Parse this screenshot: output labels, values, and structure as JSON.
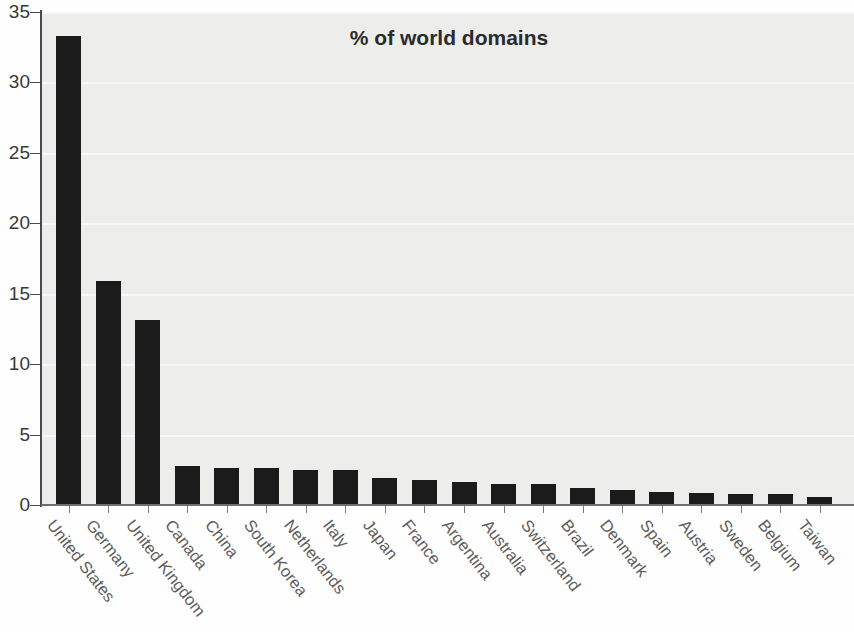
{
  "chart_data": {
    "type": "bar",
    "title": "% of world domains",
    "xlabel": "",
    "ylabel": "",
    "ylim": [
      0,
      35
    ],
    "yticks": [
      0,
      5,
      10,
      15,
      20,
      25,
      30,
      35
    ],
    "grid": true,
    "legend": null,
    "bar_color": "#1b1b1b",
    "plot_background": "#ededec",
    "categories": [
      "United States",
      "Germany",
      "United Kingdom",
      "Canada",
      "China",
      "South Korea",
      "Netherlands",
      "Italy",
      "Japan",
      "France",
      "Argentina",
      "Australia",
      "Switzerland",
      "Brazil",
      "Denmark",
      "Spain",
      "Austria",
      "Sweden",
      "Belgium",
      "Taiwan"
    ],
    "values": [
      33.3,
      15.9,
      13.1,
      2.8,
      2.6,
      2.6,
      2.5,
      2.5,
      1.9,
      1.8,
      1.6,
      1.5,
      1.5,
      1.2,
      1.05,
      0.95,
      0.85,
      0.8,
      0.75,
      0.55
    ]
  }
}
